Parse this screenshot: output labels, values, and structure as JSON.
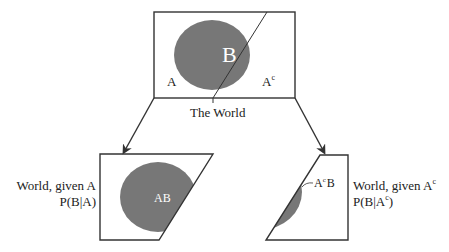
{
  "diagram": {
    "colors": {
      "stroke": "#333333",
      "fill_region": "#777777",
      "background": "#ffffff"
    },
    "world": {
      "caption": "The World",
      "region_a_label": "A",
      "region_ac_label": "A",
      "region_ac_sup": "c",
      "event_b_label": "B"
    },
    "left_panel": {
      "title": "World, given A",
      "formula": "P(B|A)",
      "region_label": "AB"
    },
    "right_panel": {
      "title": "World, given A",
      "title_sup": "c",
      "formula_pre": "P(B|A",
      "formula_sup": "c",
      "formula_post": ")",
      "region_label_a": "A",
      "region_label_sup": "c",
      "region_label_b": "B"
    }
  }
}
